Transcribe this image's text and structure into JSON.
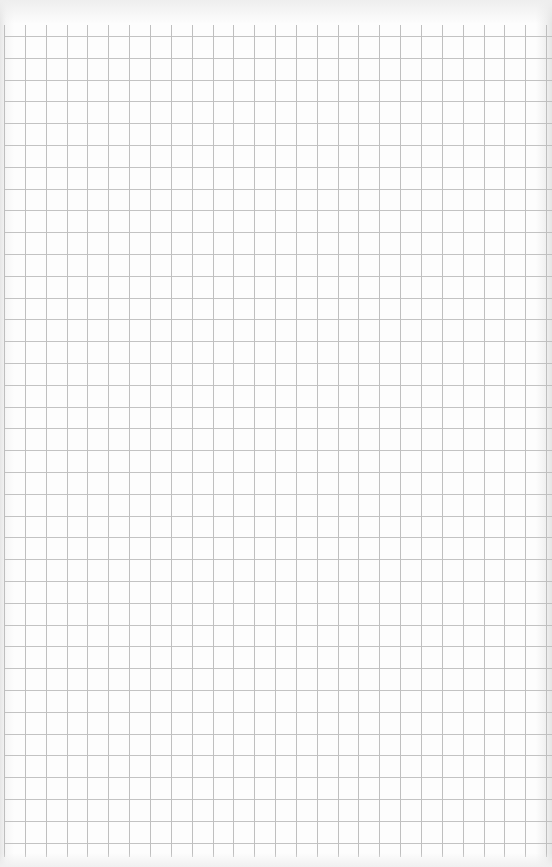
{
  "document": {
    "type": "graph-paper",
    "content": "",
    "grid": {
      "columns": 26,
      "rows": 38,
      "line_color": "#b9b9b9",
      "background_color": "#fdfdfd"
    }
  }
}
